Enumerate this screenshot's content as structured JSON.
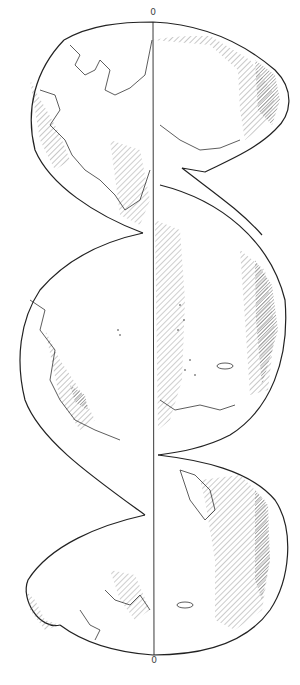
{
  "map": {
    "title": "Interrupted globe projection (three lobes)",
    "central_meridian_label_top": "0",
    "central_meridian_label_bottom": "0",
    "colors": {
      "background": "#ffffff",
      "outline": "#222222",
      "hatch": "#555555",
      "shade": "#9a9a9a"
    },
    "lobes": [
      {
        "name": "upper-lobe",
        "region": "Arctic / Eurasia-North Atlantic"
      },
      {
        "name": "middle-lobe",
        "region": "Pacific Ocean / Americas"
      },
      {
        "name": "lower-lobe",
        "region": "Southern Hemisphere / Australia-Antarctica"
      }
    ]
  }
}
